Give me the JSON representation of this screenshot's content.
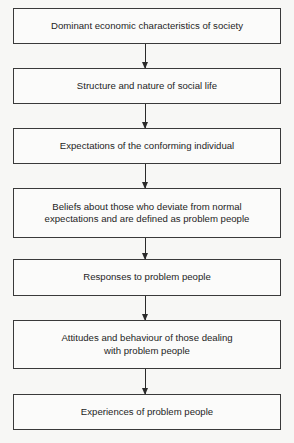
{
  "diagram": {
    "type": "vertical-flowchart",
    "nodes": [
      {
        "id": "n1",
        "label": "Dominant economic characteristics of society"
      },
      {
        "id": "n2",
        "label": "Structure and nature of social life"
      },
      {
        "id": "n3",
        "label": "Expectations of the conforming individual"
      },
      {
        "id": "n4",
        "label": "Beliefs about those who deviate from normal expectations and are defined as problem people"
      },
      {
        "id": "n5",
        "label": "Responses to problem people"
      },
      {
        "id": "n6",
        "label": "Attitudes and behaviour of those dealing with problem people"
      },
      {
        "id": "n7",
        "label": "Experiences of problem people"
      }
    ],
    "edges": [
      {
        "from": "n1",
        "to": "n2"
      },
      {
        "from": "n2",
        "to": "n3"
      },
      {
        "from": "n3",
        "to": "n4"
      },
      {
        "from": "n4",
        "to": "n5"
      },
      {
        "from": "n5",
        "to": "n6"
      },
      {
        "from": "n6",
        "to": "n7"
      }
    ]
  }
}
